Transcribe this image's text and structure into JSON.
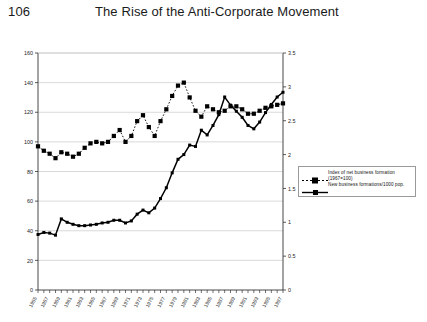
{
  "header": {
    "page_number": "106",
    "running_head": "The Rise of the Anti-Corporate Movement"
  },
  "legend": {
    "position": "right-middle",
    "entries": [
      {
        "label_line1": "Index of net business formation",
        "label_line2": "(1967=100)",
        "marker": "square",
        "line_style": "dotted",
        "color": "#000000"
      },
      {
        "label_line1": "New business formations/1000 pop.",
        "label_line2": "",
        "marker": "small-square",
        "line_style": "solid",
        "color": "#000000"
      }
    ]
  },
  "chart_data": {
    "type": "line",
    "title": "",
    "subtitle": "",
    "xlabel": "",
    "ylabel": "",
    "y2label": "",
    "grid": true,
    "gridlines": "horizontal",
    "xlim": [
      1955,
      1997
    ],
    "ylim": [
      0,
      160
    ],
    "y2lim": [
      0,
      3.5
    ],
    "yticks": [
      0,
      20,
      40,
      60,
      80,
      100,
      120,
      140,
      160
    ],
    "ytick_labels": [
      "0",
      "20",
      "40",
      "60",
      "80",
      "100",
      "120",
      "140",
      "160"
    ],
    "y2ticks": [
      0,
      0.5,
      1,
      1.5,
      2,
      2.5,
      3,
      3.5
    ],
    "y2tick_labels": [
      "0",
      "0.5",
      "1",
      "1.5",
      "2",
      "2.5",
      "3",
      "3.5"
    ],
    "x": [
      1955,
      1956,
      1957,
      1958,
      1959,
      1960,
      1961,
      1962,
      1963,
      1964,
      1965,
      1966,
      1967,
      1968,
      1969,
      1970,
      1971,
      1972,
      1973,
      1974,
      1975,
      1976,
      1977,
      1978,
      1979,
      1980,
      1981,
      1982,
      1983,
      1984,
      1985,
      1986,
      1987,
      1988,
      1989,
      1990,
      1991,
      1992,
      1993,
      1994,
      1995,
      1996,
      1997
    ],
    "xtick_labels": [
      "1955",
      "1957",
      "1959",
      "1961",
      "1963",
      "1965",
      "1967",
      "1969",
      "1971",
      "1973",
      "1975",
      "1977",
      "1979",
      "1981",
      "1983",
      "1985",
      "1987",
      "1989",
      "1991",
      "1993",
      "1995",
      "1997"
    ],
    "xtick_rotation": -45,
    "series": [
      {
        "name": "Index of net business formation (1967=100)",
        "axis": "left",
        "style": "dotted",
        "marker": "square",
        "values": [
          97,
          94,
          92,
          89,
          93,
          92,
          90,
          92,
          96,
          99,
          100,
          99,
          100,
          104,
          108,
          100,
          104,
          114,
          118,
          110,
          104,
          114,
          122,
          131,
          138,
          140,
          130,
          121,
          117,
          124,
          122,
          120,
          121,
          124,
          124,
          122,
          119,
          119,
          121,
          123,
          124,
          125,
          126
        ]
      },
      {
        "name": "New business formations/1000 pop.",
        "axis": "right",
        "style": "solid",
        "marker": "small-square",
        "values": [
          0.82,
          0.85,
          0.84,
          0.81,
          1.05,
          1.0,
          0.97,
          0.95,
          0.95,
          0.96,
          0.97,
          0.99,
          1.0,
          1.03,
          1.03,
          0.99,
          1.02,
          1.12,
          1.18,
          1.14,
          1.21,
          1.35,
          1.51,
          1.73,
          1.93,
          2.0,
          2.14,
          2.12,
          2.36,
          2.29,
          2.43,
          2.59,
          2.85,
          2.73,
          2.64,
          2.55,
          2.43,
          2.38,
          2.48,
          2.62,
          2.74,
          2.85,
          2.92
        ]
      }
    ]
  }
}
